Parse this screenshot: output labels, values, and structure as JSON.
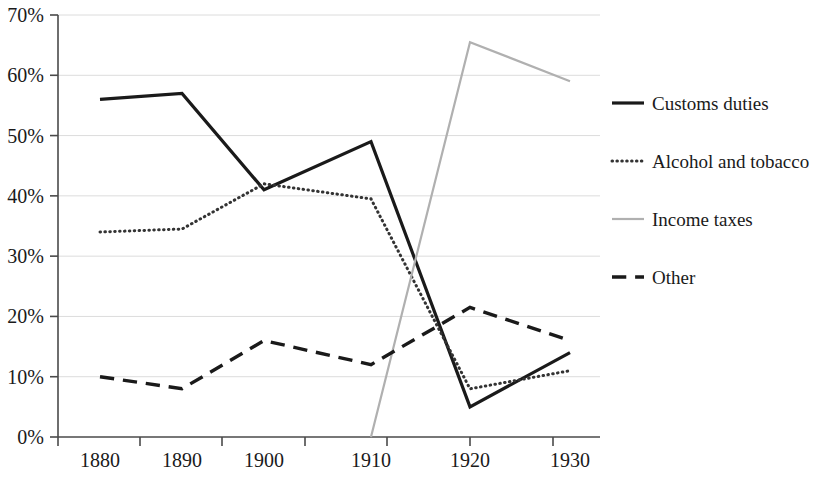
{
  "chart_data": {
    "type": "line",
    "title": "",
    "xlabel": "",
    "ylabel": "",
    "x": [
      1880,
      1890,
      1900,
      1910,
      1920,
      1930
    ],
    "categories": [
      "1880",
      "1890",
      "1900",
      "1910",
      "1920",
      "1930"
    ],
    "xlim": [
      1875,
      1935
    ],
    "ylim": [
      0,
      70
    ],
    "ytick_labels": [
      "0%",
      "10%",
      "20%",
      "30%",
      "40%",
      "50%",
      "60%",
      "70%"
    ],
    "ytick_values": [
      0,
      10,
      20,
      30,
      40,
      50,
      60,
      70
    ],
    "grid": true,
    "grid_axis": "y",
    "legend_position": "right",
    "series": [
      {
        "name": "Customs duties",
        "style": "solid",
        "color": "#1a1a1a",
        "width": 3.2,
        "values": [
          56,
          57,
          41,
          49,
          5,
          14
        ]
      },
      {
        "name": "Alcohol and tobacco",
        "style": "dotted",
        "color": "#333333",
        "width": 3.0,
        "values": [
          34,
          34.5,
          42,
          39.5,
          8,
          11
        ]
      },
      {
        "name": "Income taxes",
        "style": "solid",
        "color": "#b0b0b0",
        "width": 2.2,
        "values": [
          null,
          null,
          null,
          0,
          65.5,
          59
        ]
      },
      {
        "name": "Other",
        "style": "dashed",
        "color": "#1a1a1a",
        "width": 3.4,
        "values": [
          10,
          8,
          16,
          12,
          21.5,
          16
        ]
      }
    ]
  },
  "legend": {
    "items": [
      {
        "label": "Customs duties"
      },
      {
        "label": "Alcohol and tobacco"
      },
      {
        "label": "Income taxes"
      },
      {
        "label": "Other"
      }
    ]
  }
}
